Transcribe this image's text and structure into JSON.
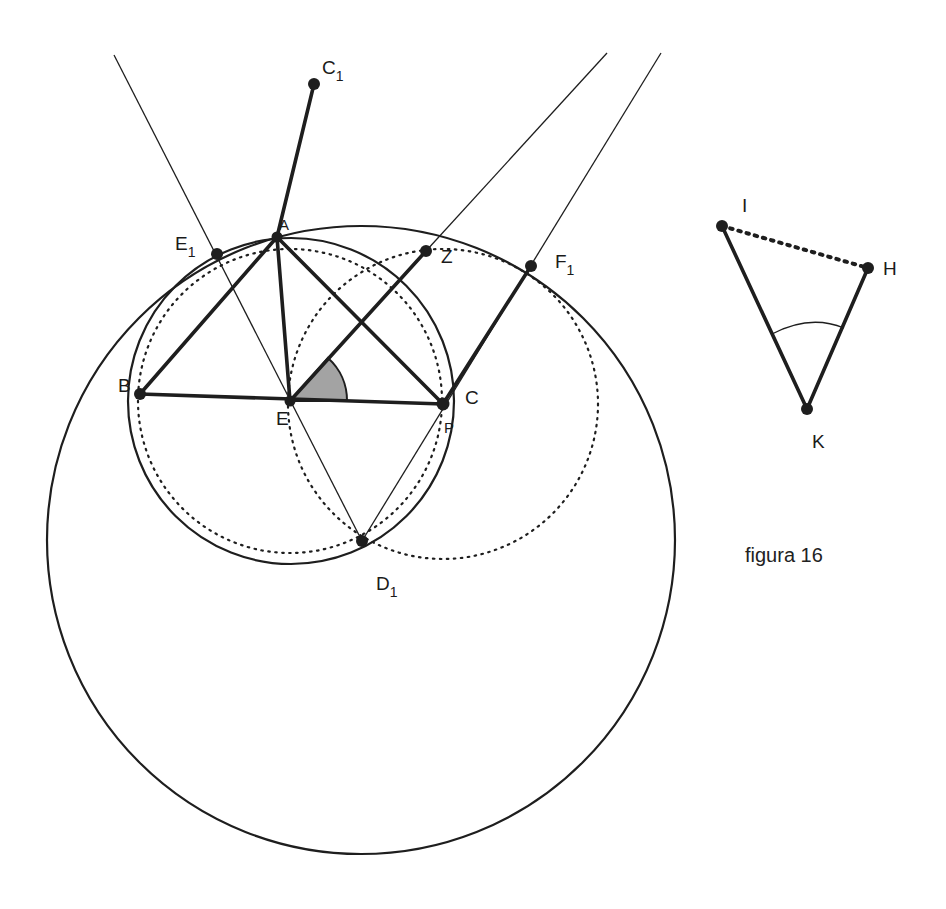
{
  "caption": "figura 16",
  "colors": {
    "ink": "#1e1e1e",
    "angle_fill": "#a3a3a3",
    "background": "#ffffff"
  },
  "points": {
    "A": {
      "label": "A",
      "sub": "",
      "x": 277,
      "y": 237
    },
    "B": {
      "label": "B",
      "sub": "",
      "x": 140,
      "y": 394
    },
    "C": {
      "label": "C",
      "sub": "",
      "x": 443,
      "y": 404
    },
    "E": {
      "label": "E",
      "sub": "",
      "x": 290,
      "y": 401
    },
    "C1": {
      "label": "C",
      "sub": "1",
      "x": 314,
      "y": 84
    },
    "E1": {
      "label": "E",
      "sub": "1",
      "x": 217,
      "y": 254
    },
    "F1": {
      "label": "F",
      "sub": "1",
      "x": 531,
      "y": 266
    },
    "D1": {
      "label": "D",
      "sub": "1",
      "x": 362,
      "y": 541
    },
    "Z": {
      "label": "Z",
      "sub": "",
      "x": 426,
      "y": 251
    },
    "P": {
      "label": "P",
      "sub": "",
      "x": 450,
      "y": 428
    },
    "I": {
      "label": "I",
      "sub": "",
      "x": 722,
      "y": 226
    },
    "H": {
      "label": "H",
      "sub": "",
      "x": 868,
      "y": 268
    },
    "K": {
      "label": "K",
      "sub": "",
      "x": 807,
      "y": 409
    }
  },
  "circles": [
    {
      "name": "outer-circle",
      "cx": 361,
      "cy": 540,
      "r": 314,
      "style": "solid"
    },
    {
      "name": "circumcircle-abc",
      "cx": 291,
      "cy": 401,
      "r": 163,
      "style": "solid"
    },
    {
      "name": "dotted-circle-center-e",
      "cx": 290,
      "cy": 401,
      "r": 152,
      "style": "dotted"
    },
    {
      "name": "dotted-circle-center-c",
      "cx": 443,
      "cy": 404,
      "r": 155,
      "style": "dotted"
    }
  ],
  "angle_marker": {
    "vertex": "E",
    "from_deg": 0,
    "to_deg": 48,
    "radius": 57
  },
  "angle_hk_arc": {
    "vertex": "K",
    "radius": 90
  }
}
